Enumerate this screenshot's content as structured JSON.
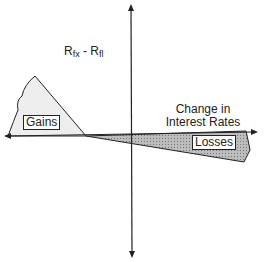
{
  "diagram": {
    "y_axis_label": {
      "main1": "R",
      "sub1": "fx",
      "sep": " - ",
      "main2": "R",
      "sub2": "fl"
    },
    "x_axis_label_line1": "Change in",
    "x_axis_label_line2": "Interest Rates",
    "region_gains_label": "Gains",
    "region_losses_label": "Losses",
    "colors": {
      "axis": "#222222",
      "gains_fill": "#eeeeee",
      "losses_fill": "#aaaaaa"
    }
  }
}
